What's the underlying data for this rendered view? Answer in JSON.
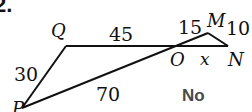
{
  "problem": {
    "number": "2.",
    "answer": "No"
  },
  "diagram": {
    "vertices": {
      "P": "P",
      "Q": "Q",
      "O": "O",
      "M": "M",
      "N": "N"
    },
    "segments": {
      "PQ": "30",
      "QO": "45",
      "PO": "70",
      "OM": "15",
      "MN": "10",
      "ON": "x"
    },
    "colors": {
      "line": "#111111",
      "answer": "#4a4a4a"
    }
  }
}
